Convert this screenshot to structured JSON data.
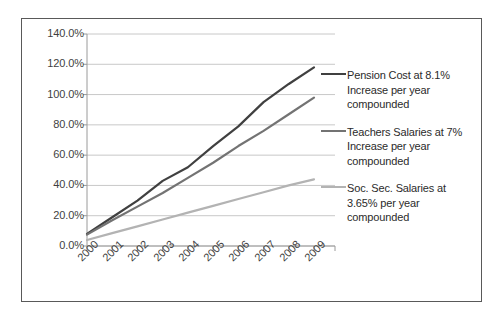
{
  "chart_data": {
    "type": "line",
    "title": "",
    "xlabel": "",
    "ylabel": "",
    "grid": true,
    "legend_position": "right",
    "categories": [
      "2000",
      "2001",
      "2002",
      "2003",
      "2004",
      "2005",
      "2006",
      "2007",
      "2008",
      "2009"
    ],
    "ylim": [
      0,
      140
    ],
    "ytick_labels": [
      "140.0%",
      "120.0%",
      "100.0%",
      "80.0%",
      "60.0%",
      "40.0%",
      "20.0%",
      "0.0%"
    ],
    "ytick_values": [
      140,
      120,
      100,
      80,
      60,
      40,
      20,
      0
    ],
    "series": [
      {
        "name": "Pension Cost at 8.1% Increase per year compounded",
        "color": "#404040",
        "values": [
          8.0,
          19.0,
          30.0,
          43.0,
          52.0,
          66.0,
          79.0,
          95.0,
          107.0,
          118.0
        ]
      },
      {
        "name": "Teachers Salaries at 7% Increase per year compounded",
        "color": "#737373",
        "values": [
          7.5,
          17.0,
          26.0,
          35.0,
          45.0,
          55.0,
          66.0,
          76.0,
          87.0,
          98.0
        ]
      },
      {
        "name": "Soc. Sec. Salaries at 3.65% per year compounded",
        "color": "#b3b3b3",
        "values": [
          4.0,
          8.5,
          13.0,
          17.5,
          22.0,
          26.5,
          31.0,
          35.5,
          40.0,
          44.0
        ]
      }
    ]
  },
  "legend": {
    "items": [
      {
        "label": "Pension Cost at 8.1% Increase per year compounded",
        "color": "#404040"
      },
      {
        "label": "Teachers Salaries at 7% Increase per year compounded",
        "color": "#737373"
      },
      {
        "label": "Soc. Sec. Salaries at 3.65% per year compounded",
        "color": "#b3b3b3"
      }
    ]
  }
}
